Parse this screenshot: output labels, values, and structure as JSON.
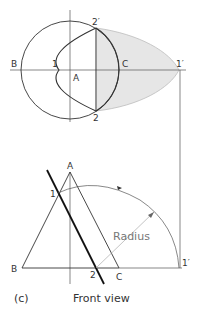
{
  "figure": {
    "caption_letter": "(c)",
    "view_label": "Front view",
    "dimension_label": "Radius",
    "colors": {
      "line": "#333333",
      "thin_line": "#555555",
      "shade_fill": "#e6e6e6",
      "shade_edge": "#bdbdbd",
      "construction": "#9a9a9a"
    }
  },
  "top_view": {
    "labels": {
      "B": "B",
      "A": "A",
      "C": "C",
      "p1": "1",
      "p1_prime": "1′",
      "p2": "2",
      "p2_prime": "2′"
    }
  },
  "front_view": {
    "labels": {
      "A": "A",
      "B": "B",
      "C": "C",
      "p1": "1",
      "p2": "2",
      "p1_prime": "1′"
    }
  }
}
